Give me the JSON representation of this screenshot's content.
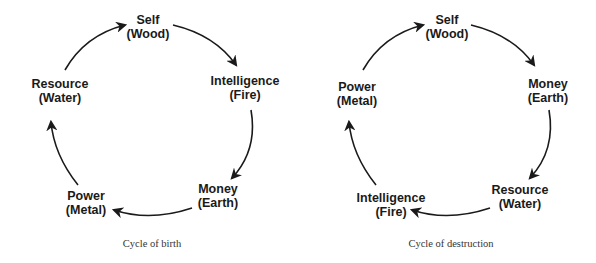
{
  "colors": {
    "ink": "#1a1a1a",
    "caption": "#333333",
    "background": "#ffffff"
  },
  "diagrams": [
    {
      "caption": "Cycle of birth",
      "nodes": [
        {
          "role": "Self",
          "element": "(Wood)"
        },
        {
          "role": "Intelligence",
          "element": "(Fire)"
        },
        {
          "role": "Money",
          "element": "(Earth)"
        },
        {
          "role": "Power",
          "element": "(Metal)"
        },
        {
          "role": "Resource",
          "element": "(Water)"
        }
      ],
      "cycle_order": [
        "Self (Wood)",
        "Intelligence (Fire)",
        "Money (Earth)",
        "Power (Metal)",
        "Resource (Water)"
      ]
    },
    {
      "caption": "Cycle of destruction",
      "nodes": [
        {
          "role": "Self",
          "element": "(Wood)"
        },
        {
          "role": "Money",
          "element": "(Earth)"
        },
        {
          "role": "Resource",
          "element": "(Water)"
        },
        {
          "role": "Intelligence",
          "element": "(Fire)"
        },
        {
          "role": "Power",
          "element": "(Metal)"
        }
      ],
      "cycle_order": [
        "Self (Wood)",
        "Money (Earth)",
        "Resource (Water)",
        "Intelligence (Fire)",
        "Power (Metal)"
      ]
    }
  ]
}
